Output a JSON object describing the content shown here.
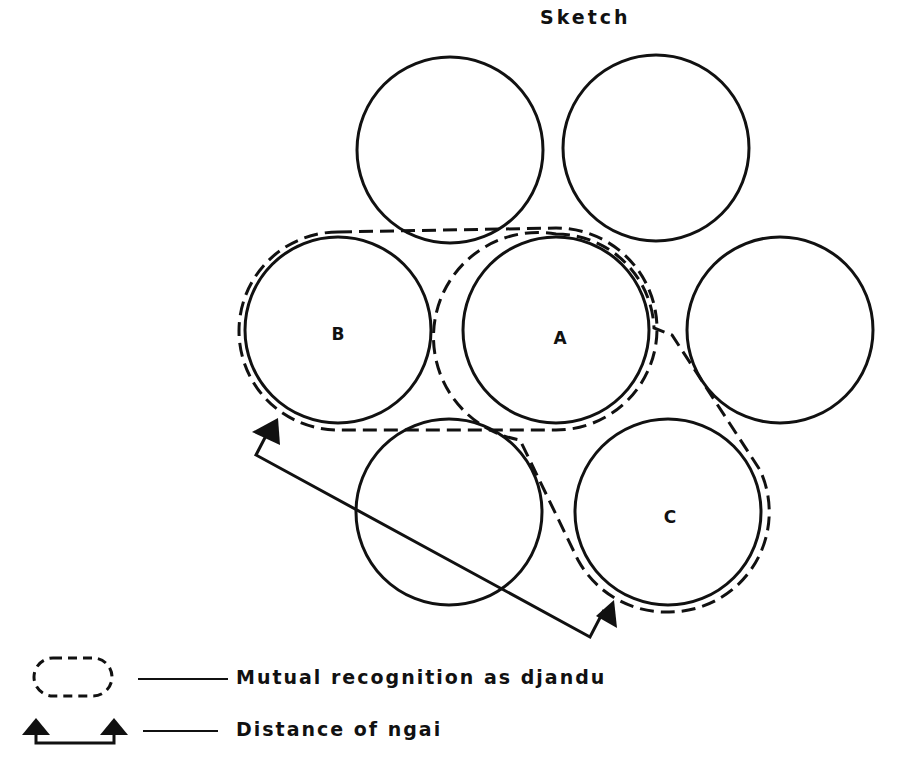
{
  "title": "Sketch",
  "diagram": {
    "circles": [
      {
        "id": "top-left",
        "label": "",
        "cx": 450,
        "cy": 150,
        "r": 93
      },
      {
        "id": "top-right",
        "label": "",
        "cx": 656,
        "cy": 148,
        "r": 93
      },
      {
        "id": "B",
        "label": "B",
        "cx": 338,
        "cy": 330,
        "r": 93
      },
      {
        "id": "A",
        "label": "A",
        "cx": 556,
        "cy": 330,
        "r": 93
      },
      {
        "id": "right",
        "label": "",
        "cx": 780,
        "cy": 330,
        "r": 93
      },
      {
        "id": "bottom-left",
        "label": "",
        "cx": 449,
        "cy": 512,
        "r": 93
      },
      {
        "id": "C",
        "label": "C",
        "cx": 668,
        "cy": 512,
        "r": 93
      }
    ],
    "groupings": [
      {
        "name": "B-A djandu group",
        "members": [
          "B",
          "A"
        ]
      },
      {
        "name": "A-C djandu group",
        "members": [
          "A",
          "C"
        ]
      }
    ],
    "distance_arrow": {
      "from": "B",
      "to": "C"
    }
  },
  "legend": {
    "items": [
      {
        "symbol": "dashed-oval",
        "label": "Mutual recognition as djandu"
      },
      {
        "symbol": "double-arrow-bracket",
        "label": "Distance of ngai"
      }
    ]
  },
  "colors": {
    "ink": "#111111",
    "background": "#ffffff"
  }
}
